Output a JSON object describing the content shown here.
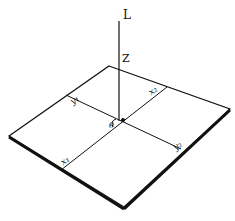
{
  "diagram": {
    "type": "isometric-plate-geometry",
    "colors": {
      "line": "#111111",
      "background": "#ffffff"
    },
    "labels": {
      "top": "L",
      "vertical_axis": "Z",
      "origin_angle": "θ",
      "y1": "y₁",
      "x2": "x₂",
      "x1": "x₁",
      "y2": "y₂"
    }
  }
}
